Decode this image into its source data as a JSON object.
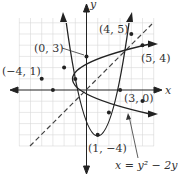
{
  "axes": {
    "x_label": "x",
    "y_label": "y",
    "xlim": [
      -6,
      6
    ],
    "ylim": [
      -5,
      7
    ]
  },
  "equation": "x = y² − 2y − 3",
  "points": [
    {
      "label": "(0, 3)",
      "x": 0,
      "y": 3
    },
    {
      "label": "(4, 5)",
      "x": 4,
      "y": 5
    },
    {
      "label": "(−4, 1)",
      "x": -4,
      "y": 1
    },
    {
      "label": "(5, 4)",
      "x": 5,
      "y": 4
    },
    {
      "label": "(3, 0)",
      "x": 3,
      "y": 0
    },
    {
      "label": "(1, −4)",
      "x": 1,
      "y": -4
    }
  ],
  "curves": [
    {
      "name": "sideways parabola",
      "equation": "x = y^2 - 2y - 3"
    },
    {
      "name": "vertical parabola (reflection)",
      "equation": "y = x^2 - 2x - 3"
    },
    {
      "name": "line y = x",
      "style": "dashed"
    }
  ]
}
